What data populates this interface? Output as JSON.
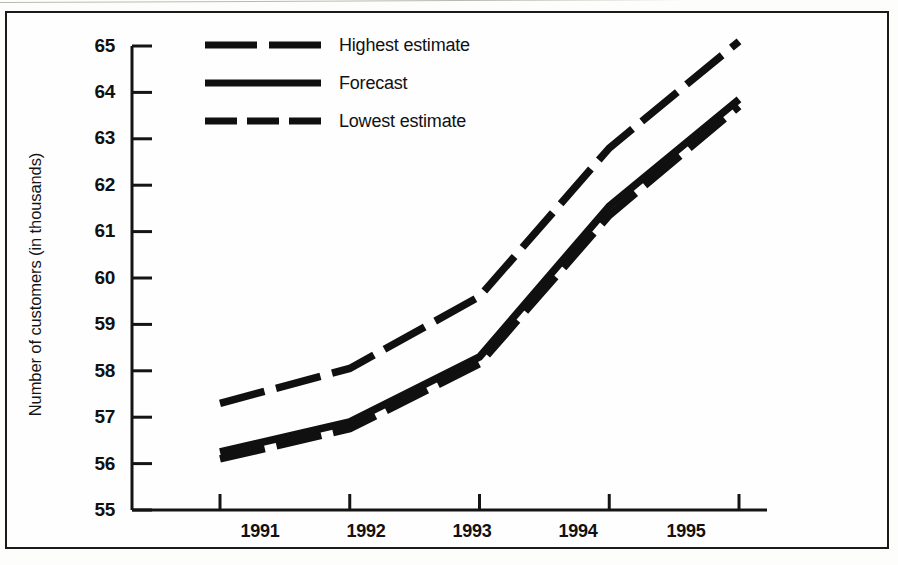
{
  "figure": {
    "border_color": "#1b1b1b",
    "background": "#fefefe"
  },
  "chart_data": {
    "type": "line",
    "title": "",
    "xlabel": "",
    "ylabel": "Number of customers (in thousands)",
    "categories": [
      "1991",
      "1992",
      "1993",
      "1994",
      "1995"
    ],
    "x": [
      1991,
      1992,
      1993,
      1994,
      1995
    ],
    "ylim": [
      55,
      65
    ],
    "xlim": [
      1991,
      1995
    ],
    "yticks": [
      "65",
      "64",
      "63",
      "62",
      "61",
      "60",
      "59",
      "58",
      "57",
      "56",
      "55"
    ],
    "ytick_values": [
      65,
      64,
      63,
      62,
      61,
      60,
      59,
      58,
      57,
      56,
      55
    ],
    "grid": false,
    "legend_position": "top-center",
    "series": [
      {
        "name": "Highest estimate",
        "style": "dashed",
        "color": "#101010",
        "values": [
          57.3,
          58.05,
          59.6,
          62.8,
          65.1
        ]
      },
      {
        "name": "Forecast",
        "style": "solid",
        "color": "#101010",
        "values": [
          56.25,
          56.9,
          58.3,
          61.55,
          63.85
        ]
      },
      {
        "name": "Lowest estimate",
        "style": "dashed",
        "color": "#101010",
        "values": [
          56.1,
          56.75,
          58.15,
          61.35,
          63.7
        ]
      }
    ]
  },
  "legend": {
    "items": [
      {
        "label": "Highest estimate",
        "style": "dashed"
      },
      {
        "label": "Forecast",
        "style": "solid"
      },
      {
        "label": "Lowest estimate",
        "style": "dashed"
      }
    ]
  }
}
